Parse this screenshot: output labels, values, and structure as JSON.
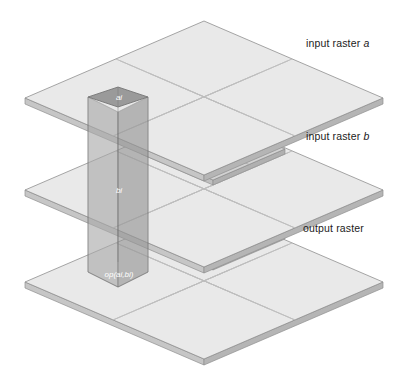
{
  "figure": {
    "type": "isometric-layer-diagram",
    "background_color": "#ffffff",
    "width": 404,
    "height": 366
  },
  "labels": {
    "input_a": {
      "text": "input raster ",
      "italic_part": "a"
    },
    "input_b": {
      "text": "input raster ",
      "italic_part": "b"
    },
    "output": {
      "text": "output raster",
      "italic_part": ""
    }
  },
  "cell_labels": {
    "top": "ai",
    "middle": "bi",
    "bottom": "op(ai,bi)"
  },
  "layers": [
    {
      "name": "input-raster-a",
      "label": "input raster a",
      "cell_label": "ai",
      "grid_rows": 6,
      "grid_cols": 6,
      "order": 1
    },
    {
      "name": "input-raster-b",
      "label": "input raster b",
      "cell_label": "bi",
      "grid_rows": 6,
      "grid_cols": 6,
      "order": 2
    },
    {
      "name": "output-raster",
      "label": "output raster",
      "cell_label": "op(ai,bi)",
      "grid_rows": 6,
      "grid_cols": 6,
      "order": 3
    }
  ],
  "colors": {
    "plane_top_fill": "#e9e9e9",
    "plane_edge_fill": "#cfcfcf",
    "plane_edge_dark": "#b8b8b8",
    "plane_stroke": "#8f8f8f",
    "grid_line": "#bdbdbd",
    "column_left_face": "#a9a9a9",
    "column_right_face": "#959595",
    "column_top_face": "#9a9a9a",
    "column_stroke": "#6f6f6f",
    "subraster_fill": "#d2d2d2",
    "subraster_stroke": "#8a8a8a",
    "label_text": "#1b1b1b",
    "cell_text": "#ffffff"
  },
  "geometry": {
    "plane_apex_top_y": 21,
    "plane_left_x": 25,
    "plane_right_x": 383,
    "layer_y_offsets": [
      60,
      152,
      244
    ],
    "column_center_x": 118,
    "column_half_width": 30,
    "column_top_y": 87,
    "column_bottom_y": 287
  }
}
